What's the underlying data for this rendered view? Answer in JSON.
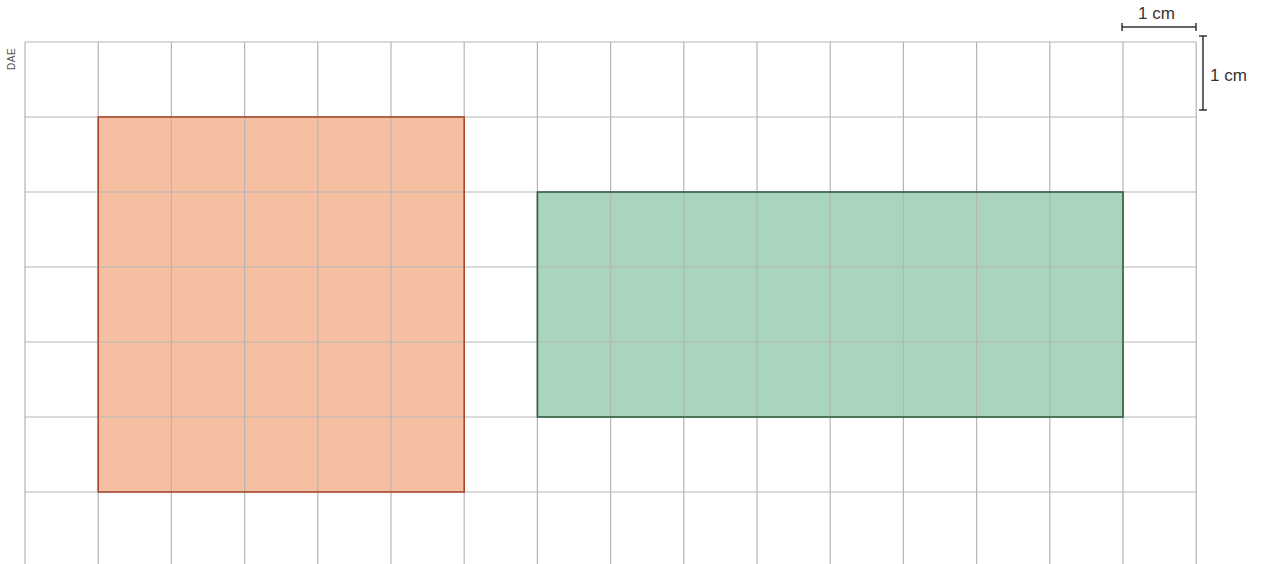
{
  "credit": "DAE",
  "scale": {
    "horizontal_label": "1 cm",
    "vertical_label": "1 cm"
  },
  "grid": {
    "left": 25,
    "top": 42,
    "cell_w": 73.2,
    "cell_h": 75.0,
    "cols": 16,
    "rows": 7,
    "bottom": 564,
    "line_color": "#b5b5b5"
  },
  "shapes": [
    {
      "name": "orange-square",
      "col": 1,
      "row": 1,
      "width_cells": 5,
      "height_cells": 5,
      "fill": "#f7bfa1",
      "stroke": "#a94a2e",
      "description": "5 cm by 5 cm square"
    },
    {
      "name": "green-rectangle",
      "col": 7,
      "row": 2,
      "width_cells": 8,
      "height_cells": 3,
      "fill": "#a9d5bc",
      "stroke": "#2f5e3f",
      "description": "8 cm by 3 cm rectangle"
    }
  ]
}
